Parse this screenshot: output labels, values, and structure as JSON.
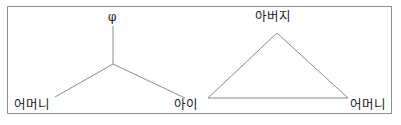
{
  "figure": {
    "border_color": "#8f8f8f",
    "line_color": "#8a8a8a",
    "text_color": "#1a1a1a",
    "background": "#ffffff",
    "left_diagram": {
      "name": "y-shaped-tripod",
      "top_label": "φ",
      "bottom_left_label": "어머니",
      "bottom_right_label": "아이",
      "junction": {
        "x": 113,
        "y": 64
      },
      "edges": [
        {
          "name": "stem",
          "x1": 113,
          "y1": 26,
          "x2": 113,
          "y2": 64
        },
        {
          "name": "left-arm",
          "x1": 113,
          "y1": 64,
          "x2": 55,
          "y2": 97
        },
        {
          "name": "right-arm",
          "x1": 113,
          "y1": 64,
          "x2": 185,
          "y2": 98
        }
      ]
    },
    "right_diagram": {
      "name": "triangle",
      "apex_label": "아버지",
      "bottom_right_label": "어머니",
      "vertices": {
        "apex": {
          "x": 277,
          "y": 33
        },
        "bottom_left": {
          "x": 208,
          "y": 98
        },
        "bottom_right": {
          "x": 348,
          "y": 98
        }
      }
    }
  }
}
